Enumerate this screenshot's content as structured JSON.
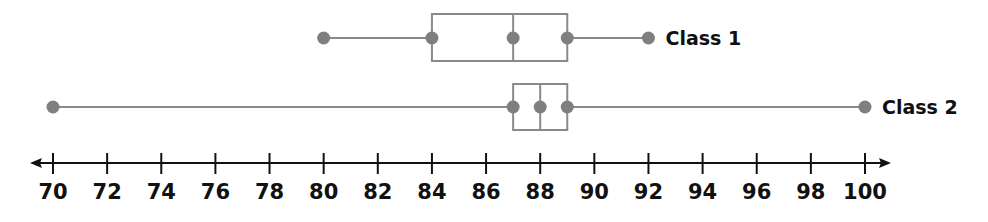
{
  "chart_data": {
    "type": "boxplot",
    "title": "",
    "xlabel": "",
    "ylabel": "",
    "xlim": [
      70,
      100
    ],
    "ticks": [
      70,
      72,
      74,
      76,
      78,
      80,
      82,
      84,
      86,
      88,
      90,
      92,
      94,
      96,
      98,
      100
    ],
    "tick_labels": [
      "70",
      "72",
      "74",
      "76",
      "78",
      "80",
      "82",
      "84",
      "86",
      "88",
      "90",
      "92",
      "94",
      "96",
      "98",
      "100"
    ],
    "grid": false,
    "axis_arrows": "both",
    "series": [
      {
        "name": "Class 1",
        "min": 80,
        "q1": 84,
        "median": 87,
        "q3": 89,
        "max": 92
      },
      {
        "name": "Class 2",
        "min": 70,
        "q1": 87,
        "median": 88,
        "q3": 89,
        "max": 100
      }
    ],
    "colors": {
      "box": "#8a8a8a",
      "point": "#7f7f7f",
      "axis": "#111111",
      "text": "#111111"
    }
  }
}
